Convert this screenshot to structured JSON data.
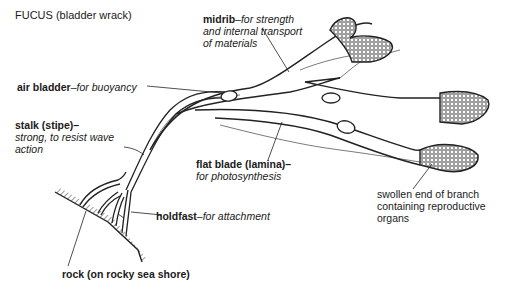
{
  "title": "FUCUS (bladder wrack)",
  "labels": {
    "midrib": {
      "term": "midrib",
      "desc_lines": [
        "–for strength",
        "and internal transport",
        "of materials"
      ]
    },
    "air_bladder": {
      "term": "air bladder",
      "desc": "–for buoyancy"
    },
    "stalk": {
      "term": "stalk (stipe)–",
      "desc_lines": [
        "strong, to resist wave",
        "action"
      ]
    },
    "flat_blade": {
      "term": "flat blade (lamina)–",
      "desc": "for photosynthesis"
    },
    "holdfast": {
      "term": "holdfast",
      "desc": "–for attachment"
    },
    "swollen_end": {
      "lines": [
        "swollen end of branch",
        "containing reproductive",
        "organs"
      ]
    },
    "rock": {
      "text": "rock (on rocky sea shore)"
    }
  },
  "colors": {
    "ink": "#1a1a1a",
    "background": "#ffffff"
  }
}
